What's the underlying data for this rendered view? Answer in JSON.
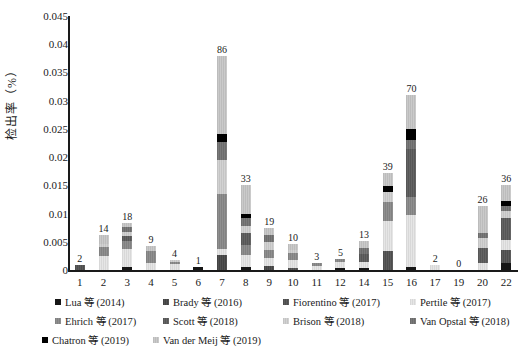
{
  "accent_color": "#1a1a1a",
  "background_color": "#ffffff",
  "y_axis": {
    "label": "检出率（%）",
    "tick_labels": [
      "0.045",
      "0.04",
      "0.035",
      "0.03",
      "0.025",
      "0.02",
      "0.015",
      "0.01",
      "0.005",
      "0"
    ],
    "max": 0.045,
    "step": 0.005
  },
  "chart_data": {
    "type": "bar",
    "stacked": true,
    "title": "",
    "xlabel": "",
    "ylabel": "检出率（%）",
    "ylim": [
      0,
      0.045
    ],
    "grid": false,
    "legend_position": "bottom",
    "categories": [
      "1",
      "2",
      "3",
      "4",
      "5",
      "6",
      "7",
      "8",
      "9",
      "10",
      "11",
      "12",
      "14",
      "15",
      "16",
      "17",
      "19",
      "20",
      "22"
    ],
    "bar_count_labels": [
      "2",
      "14",
      "18",
      "9",
      "4",
      "1",
      "86",
      "33",
      "19",
      "10",
      "3",
      "5",
      "13",
      "39",
      "70",
      "2",
      "0",
      "26",
      "36"
    ],
    "series": [
      {
        "name": "Lua 等 (2014)",
        "color": "#161616",
        "hatch": "solid",
        "values": [
          0,
          0,
          0.0005,
          0,
          0,
          0.0005,
          0,
          0.0005,
          0,
          0,
          0,
          0.0003,
          0.0003,
          0,
          0.0005,
          0,
          0,
          0,
          0.0012
        ]
      },
      {
        "name": "Brady 等 (2016)",
        "color": "#434343",
        "hatch": "vstripe",
        "values": [
          0,
          0,
          0,
          0,
          0,
          0,
          0.0027,
          0,
          0.0007,
          0,
          0,
          0,
          0,
          0,
          0,
          0,
          0,
          0,
          0
        ]
      },
      {
        "name": "Fiorentino 等 (2017)",
        "color": "#4d4d4d",
        "hatch": "vstripe",
        "values": [
          0.0009,
          0,
          0,
          0,
          0,
          0,
          0,
          0,
          0,
          0.0004,
          0,
          0,
          0,
          0.0033,
          0,
          0,
          0,
          0,
          0.0024
        ]
      },
      {
        "name": "Pertile 等 (2017)",
        "color": "#d8d8d8",
        "hatch": "vstripe",
        "values": [
          0,
          0.0025,
          0.0032,
          0.0013,
          0.001,
          0,
          0.001,
          0.0022,
          0.0014,
          0.0014,
          0.0007,
          0.0012,
          0.0012,
          0.0053,
          0.0092,
          0.0009,
          0,
          0.0012,
          0.0017
        ]
      },
      {
        "name": "Ehrich 等 (2017)",
        "color": "#818181",
        "hatch": "vstripe",
        "values": [
          0,
          0.0015,
          0.0014,
          0.002,
          0.0004,
          0,
          0.0098,
          0.0018,
          0.0014,
          0.0012,
          0.0005,
          0.0005,
          0,
          0.0035,
          0.0032,
          0,
          0,
          0,
          0
        ]
      },
      {
        "name": "Scott 等 (2018)",
        "color": "#565656",
        "hatch": "vstripe",
        "values": [
          0,
          0,
          0.001,
          0,
          0,
          0,
          0,
          0.002,
          0,
          0,
          0,
          0,
          0.0014,
          0,
          0.0085,
          0,
          0,
          0.0027,
          0.004
        ]
      },
      {
        "name": "Brison 等 (2018)",
        "color": "#c4c4c4",
        "hatch": "vstripe",
        "values": [
          0,
          0.0007,
          0.0007,
          0,
          0.0004,
          0,
          0.006,
          0.0013,
          0.0014,
          0.0006,
          0,
          0,
          0,
          0.0018,
          0,
          0,
          0,
          0.0018,
          0.0012
        ]
      },
      {
        "name": "Van Opstal 等 (2018)",
        "color": "#6c6c6c",
        "hatch": "vstripe",
        "values": [
          0,
          0,
          0.0008,
          0,
          0,
          0,
          0.0031,
          0.0015,
          0.0014,
          0,
          0,
          0,
          0.001,
          0,
          0.0016,
          0,
          0,
          0.0009,
          0.0009
        ]
      },
      {
        "name": "Chatron 等 (2019)",
        "color": "#000000",
        "hatch": "solid",
        "values": [
          0,
          0,
          0,
          0,
          0,
          0,
          0.0015,
          0.0007,
          0,
          0,
          0,
          0,
          0,
          0.001,
          0.002,
          0,
          0,
          0,
          0.0009
        ]
      },
      {
        "name": "Van der Meij 等 (2019)",
        "color": "#bcbcbc",
        "hatch": "vstripe",
        "values": [
          0,
          0.0015,
          0.0007,
          0.001,
          0,
          0,
          0.0139,
          0.005,
          0.0011,
          0.001,
          0,
          0,
          0.0012,
          0.0023,
          0.006,
          0,
          0,
          0.0048,
          0.0028
        ]
      }
    ],
    "legend_rows": [
      [
        0,
        1,
        2,
        3
      ],
      [
        4,
        5,
        6,
        7
      ],
      [
        8,
        9
      ]
    ]
  }
}
